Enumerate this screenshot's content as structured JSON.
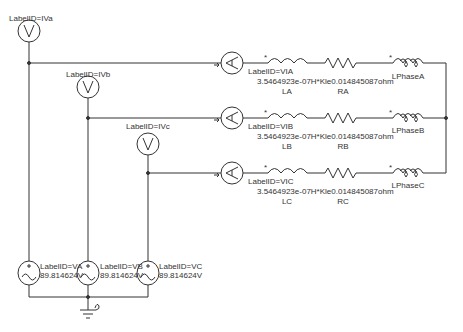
{
  "colors": {
    "wire": "#333333",
    "text": "#333333",
    "background": "#ffffff"
  },
  "voltmeters": [
    {
      "label": "LabelID=IVa",
      "symbol": "V"
    },
    {
      "label": "LabelID=IVb",
      "symbol": "V"
    },
    {
      "label": "LabelID=IVc",
      "symbol": "V"
    }
  ],
  "phases": [
    {
      "ammeter_label": "LabelID=VIA",
      "ammeter_symbol": "A",
      "param": "3.5464923e-07H*Kle0.014845087ohm",
      "inductor": "LA",
      "resistor": "RA",
      "load": "LPhaseA"
    },
    {
      "ammeter_label": "LabelID=VIB",
      "ammeter_symbol": "A",
      "param": "3.5464923e-07H*Kle0.014845087ohm",
      "inductor": "LB",
      "resistor": "RB",
      "load": "LPhaseB"
    },
    {
      "ammeter_label": "LabelID=VIC",
      "ammeter_symbol": "A",
      "param": "3.5464923e-07H*Kle0.014845087ohm",
      "inductor": "LC",
      "resistor": "RC",
      "load": "LPhaseC"
    }
  ],
  "sources": [
    {
      "label": "LabelID=VA",
      "value": "89.814624V"
    },
    {
      "label": "LabelID=VB",
      "value": "89.814624V"
    },
    {
      "label": "LabelID=VC",
      "value": "89.814624V"
    }
  ]
}
